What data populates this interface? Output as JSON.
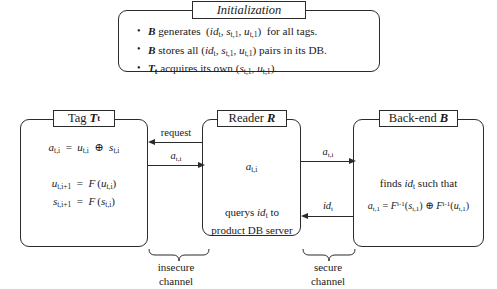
{
  "diagram": {
    "initialization": {
      "caption": "Initialization",
      "bullets": [
        {
          "id": "bullet-generates",
          "text": "B generates (id_t , s_{t,1} , u_{t,1}) for all tags."
        },
        {
          "id": "bullet-stores",
          "text": "B stores all (id_t , s_{t,1} , u_{t,1}) pairs in its DB."
        },
        {
          "id": "bullet-acquires",
          "text": "T_t acquires its own (s_{t,1} , u_{t,1})."
        }
      ]
    },
    "tag": {
      "caption": "Tag T_t",
      "caption_word": "Tag",
      "caption_symbol": "T",
      "caption_symbol_sub": "t",
      "equation_1": "a_{t,i} = u_{t,i} ⊕ s_{t,i}",
      "equation_2_line1": "u_{t,i+1} = F(u_{t,i})",
      "equation_2_line2": "s_{t,i+1} = F(s_{t,i})"
    },
    "reader": {
      "caption": "Reader R",
      "caption_word": "Reader",
      "caption_symbol": "R",
      "value": "a_{t,i}",
      "query_line1": "querys id_t to",
      "query_line2": "product DB server"
    },
    "backend": {
      "caption": "Back-end B",
      "caption_word": "Back-end",
      "caption_symbol": "B",
      "finds_text": "finds id_t such that",
      "equation": "a_{t,1} = F^{i-1}(s_{t,1}) ⊕ F^{i-1}(u_{t,1})"
    },
    "arrows": [
      {
        "id": "arrow-request",
        "label": "request",
        "direction": "left",
        "from": "reader",
        "to": "tag"
      },
      {
        "id": "arrow-tag-to-reader",
        "label": "a_{t,i}",
        "direction": "right",
        "from": "tag",
        "to": "reader"
      },
      {
        "id": "arrow-reader-to-backend",
        "label": "a_{t,i}",
        "direction": "right",
        "from": "reader",
        "to": "backend"
      },
      {
        "id": "arrow-backend-to-reader",
        "label": "id_t",
        "direction": "left",
        "from": "backend",
        "to": "reader"
      }
    ],
    "channels": [
      {
        "id": "channel-insecure",
        "line1": "insecure",
        "line2": "channel"
      },
      {
        "id": "channel-secure",
        "line1": "secure",
        "line2": "channel"
      }
    ],
    "colors": {
      "stroke": "#2b2b2b",
      "background": "#ffffff",
      "text": "#1a1a1a"
    }
  }
}
